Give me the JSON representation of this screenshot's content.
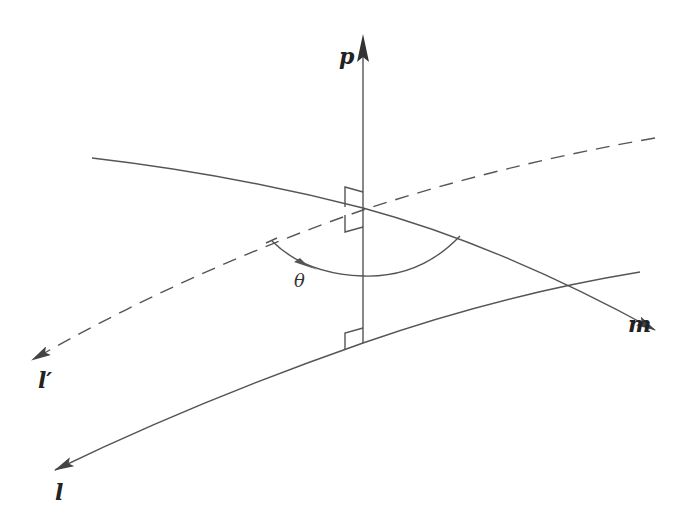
{
  "diagram": {
    "colors": {
      "line": "#555555",
      "arrow": "#444444",
      "label": "#222222",
      "background": "#ffffff"
    },
    "labels": {
      "p": "p",
      "m": "m",
      "l_prime": "l′",
      "l": "l",
      "theta": "θ"
    },
    "elements": [
      {
        "id": "p",
        "type": "line",
        "style": "solid",
        "arrow": "up"
      },
      {
        "id": "m",
        "type": "curve",
        "style": "solid",
        "arrow": "right"
      },
      {
        "id": "l_prime",
        "type": "curve",
        "style": "dashed",
        "arrow": "left"
      },
      {
        "id": "l",
        "type": "curve",
        "style": "solid",
        "arrow": "left"
      },
      {
        "id": "theta",
        "type": "arc",
        "style": "solid",
        "arrow": "counter-clockwise"
      }
    ],
    "right_angle_marks": 3
  }
}
